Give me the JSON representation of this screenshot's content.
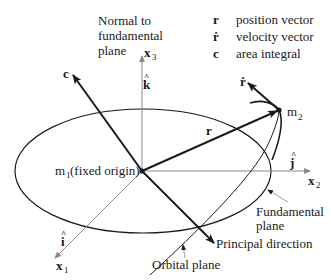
{
  "legend": [
    {
      "symbol": "r",
      "description": "position vector"
    },
    {
      "symbol": "ṙ",
      "description": "velocity vector"
    },
    {
      "symbol": "c",
      "description": "area integral"
    }
  ],
  "labels": {
    "normal": [
      "Normal to",
      "fundamental",
      "plane"
    ],
    "x3": "x",
    "x3_sub": "3",
    "k_hat": "k",
    "c_vec": "c",
    "r_vec": "r",
    "rdot_vec": "ṙ",
    "m2": "m",
    "m2_sub": "2",
    "m1": "m",
    "m1_sub": "1",
    "m1_rest": " (fixed origin)",
    "j_hat": "j",
    "x2": "x",
    "x2_sub": "2",
    "i_hat": "i",
    "x1": "x",
    "x1_sub": "1",
    "fundamental_plane": [
      "Fundamental",
      "plane"
    ],
    "principal_direction": "Principal direction",
    "orbital_plane": "Orbital plane",
    "hat": "^"
  },
  "colors": {
    "ink": "#1a1a1a",
    "axis": "#8a8a8a"
  }
}
